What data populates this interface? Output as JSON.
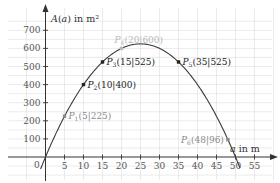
{
  "chart_data": {
    "type": "line",
    "title": "",
    "xlabel": "a in m",
    "ylabel": "A(a) in m²",
    "xlim": [
      -2,
      57
    ],
    "ylim": [
      -40,
      780
    ],
    "grid": true,
    "x_ticks": [
      5,
      10,
      15,
      20,
      25,
      30,
      35,
      40,
      45,
      50,
      55
    ],
    "y_ticks": [
      100,
      200,
      300,
      400,
      500,
      600,
      700
    ],
    "origin_label": "0",
    "function": "A(a) = -a^2 + 50a",
    "series": [
      {
        "name": "A(a)",
        "x": [
          -1,
          0,
          5,
          10,
          15,
          20,
          25,
          30,
          35,
          40,
          45,
          48,
          50,
          51
        ],
        "values": [
          -51,
          0,
          225,
          400,
          525,
          600,
          625,
          600,
          525,
          400,
          225,
          96,
          0,
          -51
        ]
      }
    ],
    "points": [
      {
        "name": "P1",
        "sub": "1",
        "x": 5,
        "y": 225,
        "label": "(5|225)",
        "style": "gray"
      },
      {
        "name": "P2",
        "sub": "2",
        "x": 10,
        "y": 400,
        "label": "(10|400)",
        "style": "dark"
      },
      {
        "name": "P3",
        "sub": "3",
        "x": 15,
        "y": 525,
        "label": "(15|525)",
        "style": "dark"
      },
      {
        "name": "P4",
        "sub": "4",
        "x": 20,
        "y": 600,
        "label": "(20|600)",
        "style": "light"
      },
      {
        "name": "P5",
        "sub": "5",
        "x": 35,
        "y": 525,
        "label": "(35|525)",
        "style": "dark"
      },
      {
        "name": "P6",
        "sub": "6",
        "x": 48,
        "y": 96,
        "label": "(48|96)",
        "style": "gray"
      }
    ]
  },
  "colors": {
    "grid": "#e3e3e3",
    "axis": "#333333",
    "curve": "#3a3a3a",
    "dark_point": "#222222",
    "gray_point": "#8a8a8a",
    "light_point": "#b8b8b8"
  }
}
